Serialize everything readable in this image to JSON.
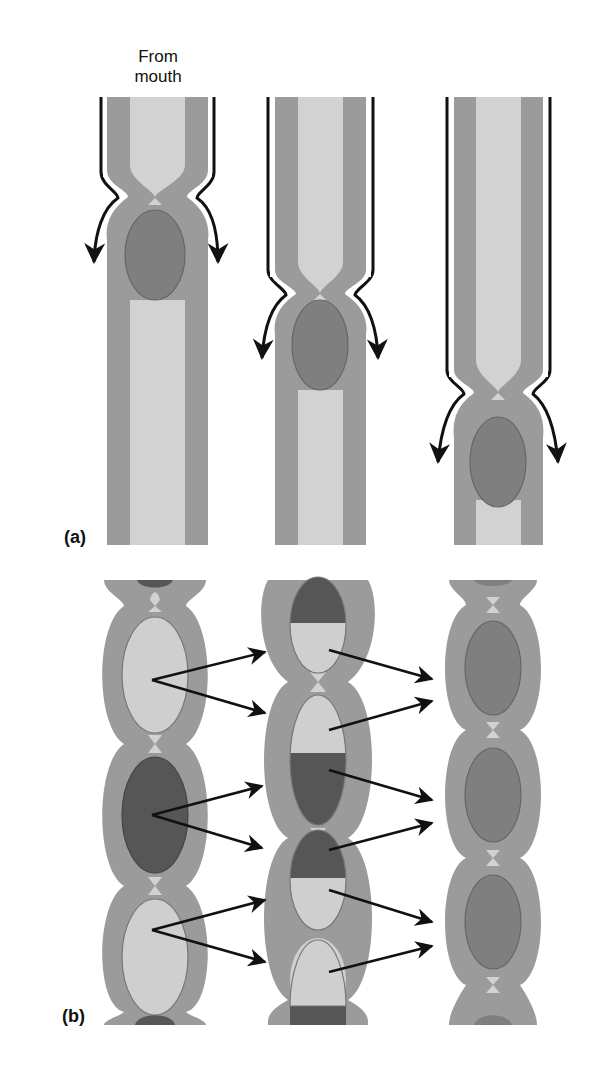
{
  "figure": {
    "panel_a": {
      "label": "(a)",
      "annotation": "From mouth",
      "annotation_lines": [
        "From",
        "mouth"
      ],
      "stages": [
        {
          "name": "stage-1",
          "constriction_y": 195,
          "bolus_cy": 255
        },
        {
          "name": "stage-2",
          "constriction_y": 292,
          "bolus_cy": 345
        },
        {
          "name": "stage-3",
          "constriction_y": 390,
          "bolus_cy": 460
        }
      ]
    },
    "panel_b": {
      "label": "(b)",
      "columns": [
        {
          "name": "segments-before",
          "contents": [
            "dark",
            "light",
            "dark",
            "light",
            "dark"
          ]
        },
        {
          "name": "segments-split",
          "contents": [
            "dark-over-light",
            "light-over-dark",
            "dark-over-light",
            "light-over-dark"
          ]
        },
        {
          "name": "segments-mixed",
          "contents": [
            "mixed",
            "mixed",
            "mixed"
          ]
        }
      ]
    },
    "colors": {
      "wall": "#9b9b9b",
      "lumen": "#d2d2d2",
      "bolus": "#7f7f7f",
      "dark_chyme": "#565656",
      "light_chyme": "#cfcfcf",
      "arrow": "#111111"
    }
  }
}
